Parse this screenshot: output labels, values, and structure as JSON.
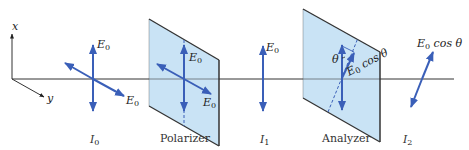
{
  "colors": {
    "arrow": "#3a5fb8",
    "plate_fill": "#c9e3f5",
    "plate_edge": "#333333",
    "axis_line": "#333333",
    "text": "#222222"
  },
  "axes": {
    "x_label": "x",
    "y_label": "y"
  },
  "stages": [
    {
      "caption_main": "I",
      "caption_sub": "0",
      "field_label": "E",
      "field_sub": "0"
    },
    {
      "caption": "Polarizer",
      "field_label": "E",
      "field_sub": "0"
    },
    {
      "caption_main": "I",
      "caption_sub": "1",
      "field_label": "E",
      "field_sub": "0"
    },
    {
      "caption": "Analyzer",
      "angle_label": "θ",
      "component_label": "E",
      "component_sub": "0",
      "component_suffix": " cos θ"
    },
    {
      "caption_main": "I",
      "caption_sub": "2",
      "field_label": "E",
      "field_sub": "0",
      "field_suffix": " cos θ"
    }
  ]
}
